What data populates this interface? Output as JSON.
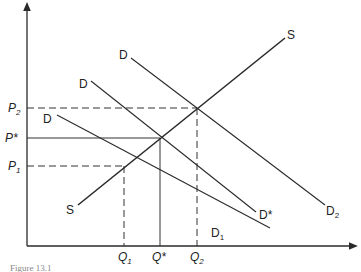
{
  "figure": {
    "caption": "Figure 13.1",
    "axes": {
      "x_label": "",
      "y_label": ""
    },
    "price_labels": [
      {
        "id": "P2",
        "text": "P",
        "sub": "2"
      },
      {
        "id": "Pstar",
        "text": "P*",
        "sub": ""
      },
      {
        "id": "P1",
        "text": "P",
        "sub": "1"
      }
    ],
    "quantity_labels": [
      {
        "id": "Q1",
        "text": "Q",
        "sub": "1"
      },
      {
        "id": "Qstar",
        "text": "Q*",
        "sub": ""
      },
      {
        "id": "Q2",
        "text": "Q",
        "sub": "2"
      }
    ],
    "curves": {
      "supply": {
        "start_label": "S",
        "end_label": "S"
      },
      "demand_1": {
        "start_label": "D",
        "end_label": "D",
        "end_sub": "1"
      },
      "demand_star": {
        "start_label": "D",
        "end_label": "D*"
      },
      "demand_2": {
        "start_label": "D",
        "end_label": "D",
        "end_sub": "2"
      }
    },
    "colors": {
      "line": "#2a2a2a",
      "text": "#222222"
    }
  }
}
